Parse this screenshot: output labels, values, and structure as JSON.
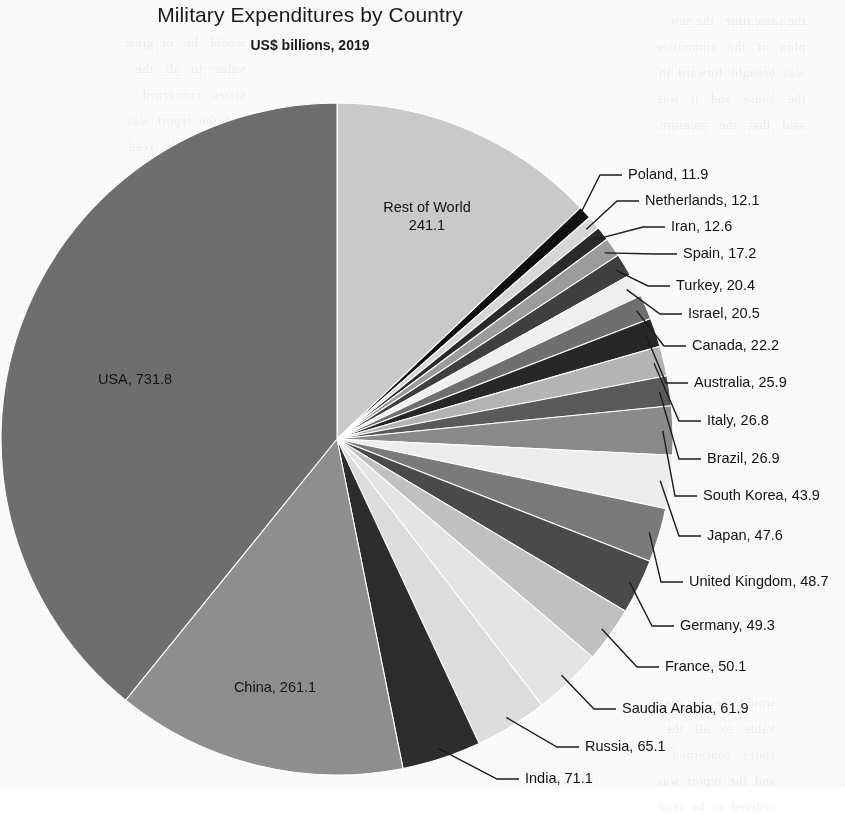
{
  "chart_data": {
    "type": "pie",
    "title": "Military Expenditures by Country",
    "subtitle": "US$ billions, 2019",
    "unit": "US$ billions",
    "year": "2019",
    "value_total": 2360.2,
    "start_angle_deg": 0,
    "direction": "clockwise",
    "legend": "none",
    "labels_mode": "callout-with-leader-lines",
    "categories": [
      "Rest of World",
      "Poland",
      "Netherlands",
      "Iran",
      "Spain",
      "Turkey",
      "Israel",
      "Canada",
      "Australia",
      "Italy",
      "Brazil",
      "South Korea",
      "Japan",
      "United Kingdom",
      "Germany",
      "France",
      "Saudia Arabia",
      "Russia",
      "India",
      "China",
      "USA"
    ],
    "values": [
      241.1,
      11.9,
      12.1,
      12.6,
      17.2,
      20.4,
      20.5,
      22.2,
      25.9,
      26.8,
      26.9,
      43.9,
      47.6,
      48.7,
      49.3,
      50.1,
      61.9,
      65.1,
      71.1,
      261.1,
      731.8
    ],
    "colors": [
      "#c9c9c9",
      "#101010",
      "#d7d7d7",
      "#2a2a2a",
      "#9b9b9b",
      "#3f3f3f",
      "#efefef",
      "#6f6f6f",
      "#272727",
      "#b4b4b4",
      "#5a5a5a",
      "#8a8a8a",
      "#ededed",
      "#7a7a7a",
      "#4a4a4a",
      "#c0c0c0",
      "#e4e4e4",
      "#dcdcdc",
      "#2d2d2d",
      "#8e8e8e",
      "#6e6e6e"
    ]
  },
  "slices": [
    {
      "name": "Rest of World",
      "value": "241.1",
      "label": "Rest of World 241.1",
      "label_line1": "Rest of World",
      "label_line2": "241.1",
      "placement": "inside",
      "x": 427,
      "y": 198
    },
    {
      "name": "Poland",
      "value": "11.9",
      "label": "Poland, 11.9",
      "placement": "callout",
      "x": 628,
      "y": 166
    },
    {
      "name": "Netherlands",
      "value": "12.1",
      "label": "Netherlands, 12.1",
      "placement": "callout",
      "x": 645,
      "y": 192
    },
    {
      "name": "Iran",
      "value": "12.6",
      "label": "Iran, 12.6",
      "placement": "callout",
      "x": 671,
      "y": 218
    },
    {
      "name": "Spain",
      "value": "17.2",
      "label": "Spain, 17.2",
      "placement": "callout",
      "x": 683,
      "y": 245
    },
    {
      "name": "Turkey",
      "value": "20.4",
      "label": "Turkey, 20.4",
      "placement": "callout",
      "x": 676,
      "y": 277
    },
    {
      "name": "Israel",
      "value": "20.5",
      "label": "Israel, 20.5",
      "placement": "callout",
      "x": 688,
      "y": 305
    },
    {
      "name": "Canada",
      "value": "22.2",
      "label": "Canada, 22.2",
      "placement": "callout",
      "x": 692,
      "y": 337
    },
    {
      "name": "Australia",
      "value": "25.9",
      "label": "Australia, 25.9",
      "placement": "callout",
      "x": 694,
      "y": 374
    },
    {
      "name": "Italy",
      "value": "26.8",
      "label": "Italy, 26.8",
      "placement": "callout",
      "x": 707,
      "y": 412
    },
    {
      "name": "Brazil",
      "value": "26.9",
      "label": "Brazil, 26.9",
      "placement": "callout",
      "x": 707,
      "y": 450
    },
    {
      "name": "South Korea",
      "value": "43.9",
      "label": "South Korea, 43.9",
      "placement": "callout",
      "x": 703,
      "y": 487
    },
    {
      "name": "Japan",
      "value": "47.6",
      "label": "Japan, 47.6",
      "placement": "callout",
      "x": 707,
      "y": 527
    },
    {
      "name": "United Kingdom",
      "value": "48.7",
      "label": "United Kingdom, 48.7",
      "placement": "callout",
      "x": 689,
      "y": 573
    },
    {
      "name": "Germany",
      "value": "49.3",
      "label": "Germany, 49.3",
      "placement": "callout",
      "x": 680,
      "y": 617
    },
    {
      "name": "France",
      "value": "50.1",
      "label": "France, 50.1",
      "placement": "callout",
      "x": 665,
      "y": 658
    },
    {
      "name": "Saudia Arabia",
      "value": "61.9",
      "label": "Saudia Arabia, 61.9",
      "placement": "callout",
      "x": 622,
      "y": 700
    },
    {
      "name": "Russia",
      "value": "65.1",
      "label": "Russia, 65.1",
      "placement": "callout",
      "x": 585,
      "y": 738
    },
    {
      "name": "India",
      "value": "71.1",
      "label": "India, 71.1",
      "placement": "callout",
      "x": 525,
      "y": 770
    },
    {
      "name": "China",
      "value": "261.1",
      "label": "China, 261.1",
      "placement": "inside",
      "x": 275,
      "y": 678
    },
    {
      "name": "USA",
      "value": "731.8",
      "label": "USA, 731.8",
      "placement": "inside",
      "x": 135,
      "y": 370
    }
  ],
  "bleed_text": {
    "col1": "the same time   the new\nplan   of   the   committee\nwas  brought  forward  in\nthe   house   and   it   was\nsaid   that   the   measure",
    "col2": "would   be   of  great\nvalue   to   all   the\nstates   concerned\nand  the  report  was\nordered  to  be  read"
  }
}
